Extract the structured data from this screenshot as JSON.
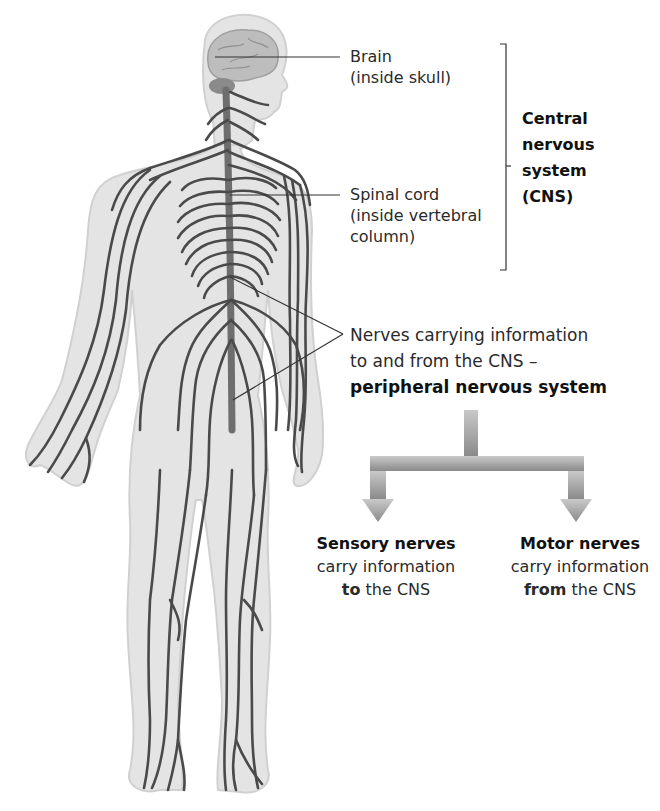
{
  "diagram": {
    "labels": {
      "brain": {
        "line1": "Brain",
        "line2": "(inside skull)"
      },
      "spinal_cord": {
        "line1": "Spinal cord",
        "line2": "(inside vertebral",
        "line3": "column)"
      },
      "cns": {
        "line1": "Central",
        "line2": "nervous",
        "line3": "system",
        "line4": "(CNS)"
      },
      "pns": {
        "line1": "Nerves carrying information",
        "line2": "to and from the CNS –",
        "line3": "peripheral nervous system"
      },
      "sensory": {
        "heading": "Sensory nerves",
        "line2": "carry information",
        "line3_bold": "to",
        "line3_rest": " the CNS"
      },
      "motor": {
        "heading": "Motor nerves",
        "line2": "carry information",
        "line3_bold": "from",
        "line3_rest": " the CNS"
      }
    },
    "colors": {
      "body_fill": "#e6e6e6",
      "body_edge": "#d2d2d2",
      "nerve": "#4a4a4a",
      "spine": "#6e6e6e",
      "brain": "#b5b5b5",
      "arrow": "#9a9a9a",
      "leader": "#333333"
    }
  }
}
